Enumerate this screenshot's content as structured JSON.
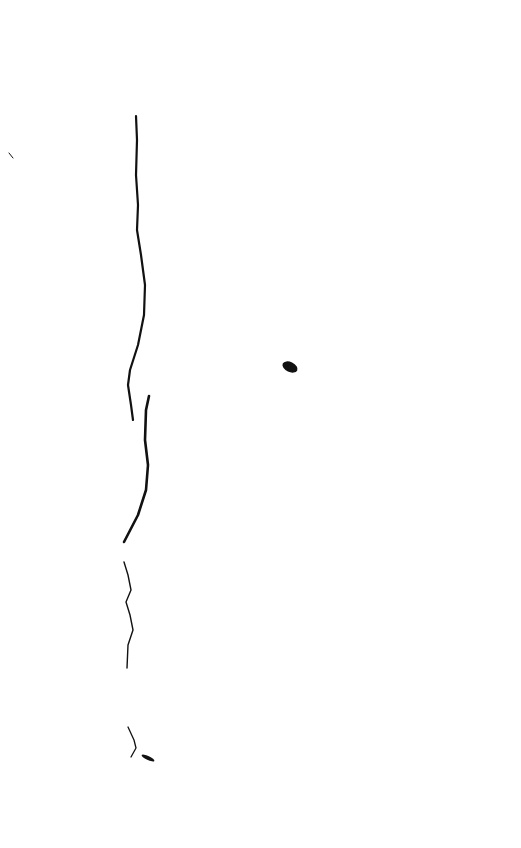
{
  "page": {
    "background": "#ffffff",
    "ink_color": "#111111",
    "width": 521,
    "height": 848
  },
  "strokes": [
    {
      "name": "edge-line-upper",
      "d": "M136 116 L137 140 L136 175 L138 205 L137 230 L141 255 L145 285 L144 315 L138 345 L130 370 L128 385 L131 405 L133 420",
      "width": 2.2
    },
    {
      "name": "edge-line-middle",
      "d": "M149 396 L146 410 L145 440 L148 465 L146 490 L138 515 L124 542",
      "width": 2.6
    },
    {
      "name": "edge-line-lower",
      "d": "M124 562 L128 575 L131 590 L126 602 L130 615 L133 630 L128 645 L127 668",
      "width": 1.4
    },
    {
      "name": "edge-line-bottom",
      "d": "M128 727 L134 740 L136 748 L131 757",
      "width": 1.3
    },
    {
      "name": "tick-mark-top-left",
      "d": "M9 153 L13 158",
      "width": 1.0
    }
  ],
  "blots": [
    {
      "name": "ink-blot-center",
      "cx": 290,
      "cy": 367,
      "rx": 8,
      "ry": 5
    },
    {
      "name": "ink-blot-bottom",
      "cx": 148,
      "cy": 758,
      "rx": 7,
      "ry": 2
    }
  ]
}
